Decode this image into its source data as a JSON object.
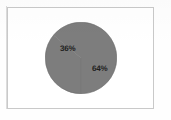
{
  "figure": {
    "frame_visible": true,
    "frame_color": "#c9c9c9",
    "background_color": "#ffffff"
  },
  "chart_data": {
    "type": "pie",
    "title": "",
    "subtitle": "",
    "xlabel": "",
    "ylabel": "",
    "grid": false,
    "legend": "none",
    "labels": [
      "36%",
      "64%"
    ],
    "categories": [
      "Segment 1",
      "Segment 2"
    ],
    "values": [
      36,
      64
    ],
    "value_unit": "%",
    "total": 100,
    "slice_colors": [
      "#7d7d7d",
      "#7d7d7d"
    ],
    "label_color": "#1f1f1f",
    "start_angle_deg": 180,
    "direction": "clockwise",
    "annotations": [
      {
        "text": "36%",
        "position": "upper-left"
      },
      {
        "text": "64%",
        "position": "lower-right"
      }
    ]
  }
}
